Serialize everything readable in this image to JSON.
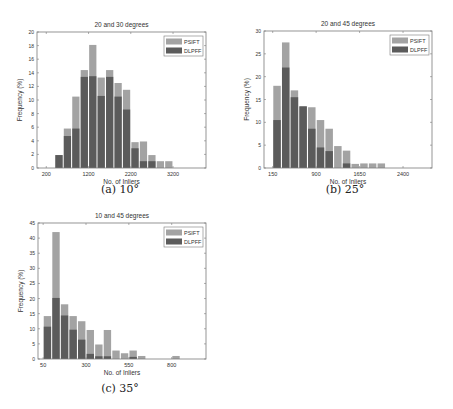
{
  "colors": {
    "psift": "#a3a3a3",
    "dlpff": "#5b5b5b",
    "axis": "#7a7a7a",
    "text": "#333333"
  },
  "legend": [
    "PSIFT",
    "DLPFF"
  ],
  "captions": [
    "(a) 10°",
    "(b) 25°",
    "(c) 35°"
  ],
  "chart_data": [
    {
      "type": "bar",
      "title": "20 and 30 degrees",
      "xlabel": "No. of Inliers",
      "ylabel": "Frequency (%)",
      "ylim": [
        0,
        20
      ],
      "yticks": [
        0,
        2,
        4,
        6,
        8,
        10,
        12,
        14,
        16,
        18,
        20
      ],
      "xticks": [
        200,
        1200,
        2200,
        3200
      ],
      "xlim": [
        -20,
        3980
      ],
      "bin_width": 200,
      "categories": [
        500,
        700,
        900,
        1100,
        1300,
        1500,
        1700,
        1900,
        2100,
        2300,
        2500,
        2700,
        2900,
        3100
      ],
      "series": [
        {
          "name": "PSIFT",
          "values": [
            1.9,
            5.8,
            10.5,
            14.4,
            18.1,
            13.3,
            14.4,
            12.5,
            11.5,
            3.8,
            3.9,
            1.9,
            1.0,
            1.0
          ]
        },
        {
          "name": "DLPFF",
          "values": [
            1.9,
            4.7,
            5.8,
            13.4,
            13.5,
            10.6,
            13.4,
            10.5,
            8.6,
            2.9,
            1.0,
            1.0,
            0,
            0
          ]
        }
      ],
      "legend_position": "top-right",
      "grid": false
    },
    {
      "type": "bar",
      "title": "20 and 45 degrees",
      "xlabel": "No. of Inliers",
      "ylabel": "Frequency (%)",
      "ylim": [
        0,
        30
      ],
      "yticks": [
        0,
        5,
        10,
        15,
        20,
        25,
        30
      ],
      "xticks": [
        150,
        900,
        1650,
        2400
      ],
      "xlim": [
        0,
        2900
      ],
      "bin_width": 150,
      "categories": [
        225,
        375,
        525,
        675,
        825,
        975,
        1125,
        1275,
        1425,
        1575,
        1725,
        1875,
        2025
      ],
      "series": [
        {
          "name": "PSIFT",
          "values": [
            18.0,
            27.5,
            17.0,
            13.5,
            13.3,
            10.5,
            8.6,
            4.8,
            3.8,
            0.9,
            1.0,
            1.0,
            1.0
          ]
        },
        {
          "name": "DLPFF",
          "values": [
            10.5,
            22.0,
            15.5,
            13.5,
            8.6,
            4.5,
            3.7,
            0,
            1.0,
            0,
            0,
            0,
            0
          ]
        }
      ],
      "legend_position": "top-right",
      "grid": false
    },
    {
      "type": "bar",
      "title": "10 and 45 degrees",
      "xlabel": "No. of Inliers",
      "ylabel": "Frequency (%)",
      "ylim": [
        0,
        45
      ],
      "yticks": [
        0,
        5,
        10,
        15,
        20,
        25,
        30,
        35,
        40,
        45
      ],
      "xticks": [
        50,
        300,
        550,
        800
      ],
      "xlim": [
        20,
        1000
      ],
      "bin_width": 50,
      "categories": [
        75,
        125,
        175,
        225,
        275,
        325,
        375,
        425,
        475,
        525,
        575,
        625,
        675,
        725,
        775,
        825
      ],
      "series": [
        {
          "name": "PSIFT",
          "values": [
            14.2,
            42.0,
            18.1,
            14.2,
            12.5,
            9.6,
            4.8,
            9.6,
            2.8,
            1.9,
            2.8,
            1.0,
            0,
            0,
            0,
            1.0
          ]
        },
        {
          "name": "DLPFF",
          "values": [
            10.7,
            20.2,
            14.4,
            9.7,
            6.4,
            1.7,
            0.9,
            0.9,
            0,
            0,
            0.7,
            0,
            0,
            0,
            0,
            0
          ]
        }
      ],
      "legend_position": "top-right",
      "grid": false
    }
  ]
}
